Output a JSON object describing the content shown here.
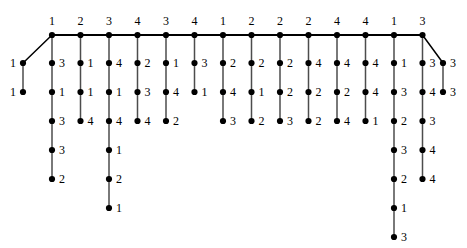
{
  "figure": {
    "title": "",
    "colors": {
      "node": "#000000",
      "edge": "#4d4d4d",
      "diagonal_edge": "#000000",
      "background": "#ffffff",
      "text": "#000000"
    },
    "geometry": {
      "width": 467,
      "height": 248,
      "spine_y": 35,
      "spine_start_x": 52,
      "spine_step_x": 28.5,
      "row_step_y": 29,
      "first_row_y": 63,
      "node_radius": 3.1
    }
  },
  "chart_data": {
    "type": "diagram",
    "graph_kind": "tree",
    "spine": {
      "count": 14,
      "labels": [
        "1",
        "2",
        "3",
        "4",
        "3",
        "4",
        "1",
        "2",
        "2",
        "2",
        "4",
        "4",
        "1",
        "3"
      ],
      "label_position": "above"
    },
    "branches": [
      {
        "spine_index": 0,
        "spine_label": "1",
        "label_side": "right",
        "children": [
          "3",
          "1",
          "3",
          "3",
          "2"
        ]
      },
      {
        "spine_index": 1,
        "spine_label": "2",
        "label_side": "right",
        "children": [
          "1",
          "1",
          "4"
        ]
      },
      {
        "spine_index": 2,
        "spine_label": "3",
        "label_side": "right",
        "children": [
          "4",
          "1",
          "4",
          "1",
          "2",
          "1"
        ]
      },
      {
        "spine_index": 3,
        "spine_label": "4",
        "label_side": "right",
        "children": [
          "2",
          "3",
          "4"
        ]
      },
      {
        "spine_index": 4,
        "spine_label": "3",
        "label_side": "right",
        "children": [
          "1",
          "4",
          "2"
        ]
      },
      {
        "spine_index": 5,
        "spine_label": "4",
        "label_side": "right",
        "children": [
          "3",
          "1"
        ]
      },
      {
        "spine_index": 6,
        "spine_label": "1",
        "label_side": "right",
        "children": [
          "2",
          "4",
          "3"
        ]
      },
      {
        "spine_index": 7,
        "spine_label": "2",
        "label_side": "right",
        "children": [
          "2",
          "1",
          "2"
        ]
      },
      {
        "spine_index": 8,
        "spine_label": "2",
        "label_side": "right",
        "children": [
          "2",
          "2",
          "3"
        ]
      },
      {
        "spine_index": 9,
        "spine_label": "2",
        "label_side": "right",
        "children": [
          "4",
          "2",
          "2"
        ]
      },
      {
        "spine_index": 10,
        "spine_label": "4",
        "label_side": "right",
        "children": [
          "4",
          "2",
          "4"
        ]
      },
      {
        "spine_index": 11,
        "spine_label": "4",
        "label_side": "right",
        "children": [
          "4",
          "4",
          "1"
        ]
      },
      {
        "spine_index": 12,
        "spine_label": "1",
        "label_side": "right",
        "children": [
          "1",
          "3",
          "2",
          "3",
          "2",
          "1",
          "3"
        ]
      },
      {
        "spine_index": 13,
        "spine_label": "3",
        "label_side": "right",
        "children": [
          "3",
          "4",
          "3",
          "4",
          "4"
        ]
      }
    ],
    "diagonals": [
      {
        "name": "left-diagonal-branch",
        "from_spine_index": 0,
        "direction": "down-left",
        "label_side": "left",
        "nodes": [
          "1",
          "1"
        ],
        "x": 23,
        "ys": [
          63,
          92
        ]
      },
      {
        "name": "right-diagonal-branch",
        "from_spine_index": 13,
        "direction": "down-right",
        "label_side": "right",
        "nodes": [
          "3",
          "3"
        ],
        "x": 443,
        "ys": [
          63,
          92
        ]
      }
    ]
  }
}
